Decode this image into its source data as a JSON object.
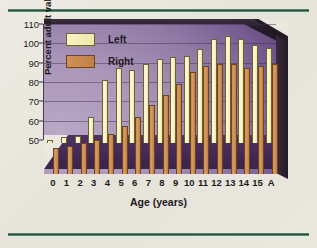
{
  "chart_data": {
    "type": "bar",
    "title": "",
    "xlabel": "Age (years)",
    "ylabel": "Percent adult value",
    "categories": [
      "0",
      "1",
      "2",
      "3",
      "4",
      "5",
      "6",
      "7",
      "8",
      "9",
      "10",
      "11",
      "12",
      "13",
      "14",
      "15",
      "A"
    ],
    "series": [
      {
        "name": "Left",
        "color": "#f5efb8",
        "values": [
          50.0,
          51.5,
          52.3,
          61.8,
          80.8,
          87.0,
          86.0,
          89.5,
          92.0,
          92.7,
          93.6,
          97.0,
          102.0,
          104.0,
          102.0,
          99.0,
          97.8
        ]
      },
      {
        "name": "Right",
        "color": "#c9854d",
        "values": [
          46.0,
          47.0,
          48.6,
          50.0,
          53.0,
          57.0,
          62.0,
          68.0,
          73.5,
          78.8,
          85.0,
          88.3,
          89.5,
          89.5,
          87.0,
          88.3,
          89.5
        ]
      }
    ],
    "ylim": [
      44,
      110
    ],
    "yticks": [
      50,
      60,
      70,
      80,
      90,
      100,
      110
    ],
    "ytick_labels": [
      "50",
      "60",
      "70",
      "80",
      "90",
      "100",
      "110"
    ],
    "grid": true,
    "legend_position": "top-left",
    "legend_entries": [
      "Left",
      "Right"
    ]
  },
  "style": {
    "plot_background": "#a995b8",
    "floor_color": "#44294f",
    "frame_color": "#17503a",
    "page_background": "#e9e7de"
  }
}
